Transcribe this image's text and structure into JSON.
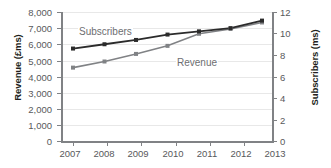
{
  "chart_data": {
    "type": "line",
    "title": "",
    "xlabel": "",
    "categories": [
      "2007",
      "2008",
      "2009",
      "2010",
      "2011",
      "2012",
      "2013"
    ],
    "grid": true,
    "legend_position": "inline-labels",
    "series": [
      {
        "name": "Revenue",
        "axis": "left",
        "color": "#808285",
        "values": [
          4550,
          4930,
          5400,
          5900,
          6650,
          6950,
          7350
        ]
      },
      {
        "name": "Subscribers",
        "axis": "right",
        "color": "#2b2b2b",
        "values": [
          8.6,
          9.0,
          9.4,
          9.9,
          10.2,
          10.5,
          11.2
        ]
      }
    ],
    "axes": {
      "left": {
        "label": "Revenue (£ms)",
        "min": 0,
        "max": 8000,
        "ticks": [
          0,
          1000,
          2000,
          3000,
          4000,
          5000,
          6000,
          7000,
          8000
        ],
        "tick_labels": [
          "0",
          "1,000",
          "2,000",
          "3,000",
          "4,000",
          "5,000",
          "6,000",
          "7,000",
          "8,000"
        ]
      },
      "right": {
        "label": "Subscribers (ms)",
        "min": 0,
        "max": 12,
        "ticks": [
          0,
          2,
          4,
          6,
          8,
          10,
          12
        ],
        "tick_labels": [
          "0",
          "2",
          "4",
          "6",
          "8",
          "10",
          "12"
        ]
      }
    },
    "annotations": [
      {
        "text": "Subscribers",
        "series": "Subscribers"
      },
      {
        "text": "Revenue",
        "series": "Revenue"
      }
    ]
  }
}
